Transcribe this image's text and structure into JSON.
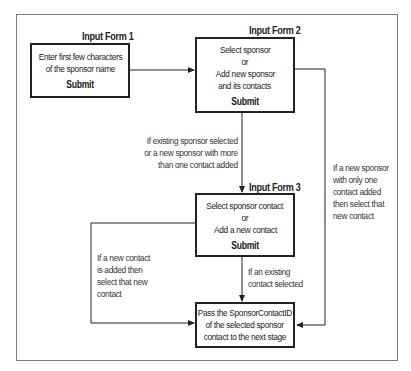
{
  "diagram": {
    "forms": [
      {
        "title": "Input Form 1",
        "lines": [
          "Enter first few characters",
          "of the sponsor name"
        ],
        "submit": "Submit"
      },
      {
        "title": "Input Form 2",
        "lines": [
          "Select sponsor",
          "or",
          "Add new sponsor",
          "and its contacts"
        ],
        "submit": "Submit"
      },
      {
        "title": "Input Form 3",
        "lines": [
          "Select sponsor contact",
          "or",
          "Add a new contact"
        ],
        "submit": "Submit"
      }
    ],
    "result": {
      "lines": [
        "Pass the SponsorContactID",
        "of the selected sponsor",
        "contact to the next stage"
      ]
    },
    "conditions": {
      "form2_to_form3": [
        "If existing sponsor selected",
        "or a new sponsor with more",
        "than one contact added"
      ],
      "form2_to_result": [
        "If a new sponsor",
        "with only one",
        "contact added",
        "then select that",
        "new contact"
      ],
      "form3_new_contact": [
        "If a new contact",
        "is added then",
        "select that new",
        "contact"
      ],
      "form3_existing_contact": [
        "If an existing",
        "contact selected"
      ]
    },
    "colors": {
      "line": "#222222",
      "frame": "#7a7a7a",
      "background": "#ffffff"
    }
  }
}
